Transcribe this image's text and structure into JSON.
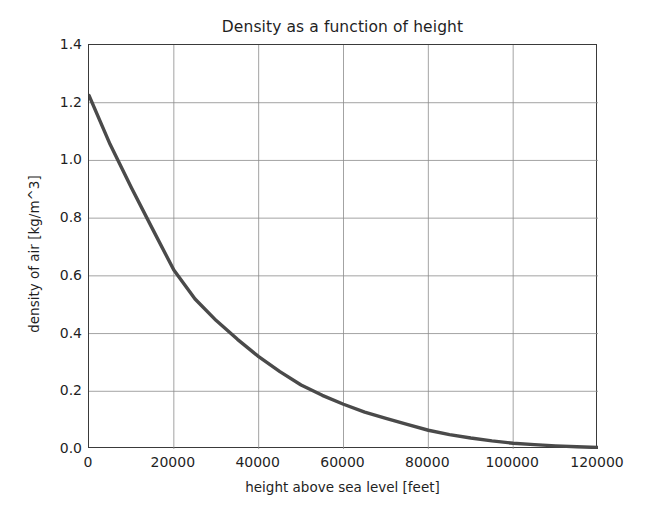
{
  "chart_data": {
    "type": "line",
    "title": "Density as a function of height",
    "xlabel": "height above sea level [feet]",
    "ylabel": "density of air [kg/m^3]",
    "xlim": [
      0,
      120000
    ],
    "ylim": [
      0.0,
      1.4
    ],
    "xticks": [
      0,
      20000,
      40000,
      60000,
      80000,
      100000,
      120000
    ],
    "xtick_labels": [
      "0",
      "20000",
      "40000",
      "60000",
      "80000",
      "100000",
      "120000"
    ],
    "yticks": [
      0.0,
      0.2,
      0.4,
      0.6,
      0.8,
      1.0,
      1.2,
      1.4
    ],
    "ytick_labels": [
      "0.0",
      "0.2",
      "0.4",
      "0.6",
      "0.8",
      "1.0",
      "1.2",
      "1.4"
    ],
    "grid": true,
    "legend": false,
    "line_color": "#4a4a4a",
    "series": [
      {
        "name": "density of air",
        "x": [
          0,
          5000,
          10000,
          15000,
          20000,
          25000,
          30000,
          35000,
          40000,
          45000,
          50000,
          55000,
          60000,
          65000,
          70000,
          75000,
          80000,
          85000,
          90000,
          95000,
          100000,
          105000,
          110000,
          115000,
          120000
        ],
        "y": [
          1.225,
          1.055,
          0.905,
          0.762,
          0.62,
          0.52,
          0.445,
          0.38,
          0.32,
          0.268,
          0.222,
          0.186,
          0.155,
          0.128,
          0.106,
          0.085,
          0.065,
          0.05,
          0.038,
          0.028,
          0.02,
          0.015,
          0.011,
          0.008,
          0.005
        ]
      }
    ]
  },
  "figure": {
    "background_color": "#ffffff",
    "axis_color": "#3a3a3a",
    "grid_color": "#8c8c8c"
  }
}
